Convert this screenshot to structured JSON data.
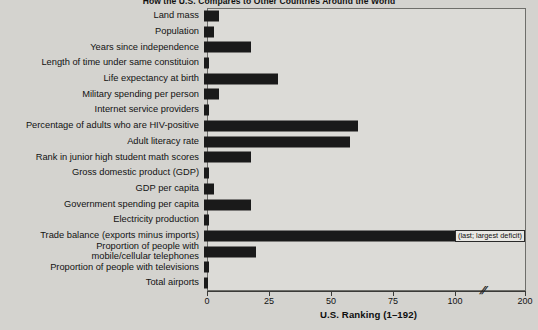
{
  "chart_data": {
    "type": "bar",
    "title": "How the U.S. Compares to Other Countries Around the World",
    "xlabel": "U.S. Ranking (1–192)",
    "ylabel": "",
    "orientation": "horizontal",
    "xlim": [
      0,
      200
    ],
    "grid": false,
    "legend": null,
    "axis_break": {
      "symbol": "//",
      "after": 100,
      "before": 200
    },
    "tick_labels": [
      "0",
      "25",
      "50",
      "75",
      "100",
      "200"
    ],
    "tick_values": [
      0,
      25,
      50,
      75,
      100,
      200
    ],
    "categories": [
      "Land mass",
      "Population",
      "Years since independence",
      "Length of time under same constituion",
      "Life expectancy at birth",
      "Military spending per person",
      "Internet service providers",
      "Percentage of adults who are HIV-positive",
      "Adult literacy rate",
      "Rank in junior high student math scores",
      "Gross domestic product (GDP)",
      "GDP per capita",
      "Government spending per capita",
      "Electricity production",
      "Trade balance (exports minus imports)",
      "Proportion of people with\nmobile/cellular telephones",
      "Proportion of people with televisions",
      "Total airports"
    ],
    "values": [
      6,
      4,
      19,
      2,
      30,
      6,
      2,
      62,
      59,
      19,
      2,
      4,
      19,
      2,
      192,
      21,
      2,
      1
    ],
    "annotations": [
      {
        "category": "Trade balance (exports minus imports)",
        "text": "(last; largest deficit)"
      }
    ],
    "colors": {
      "bar": "#1a1a1a",
      "plot_background": "#dcdbd7",
      "page_background": "#d4d3cf",
      "axis": "#3a3a38",
      "text": "#121212"
    }
  }
}
